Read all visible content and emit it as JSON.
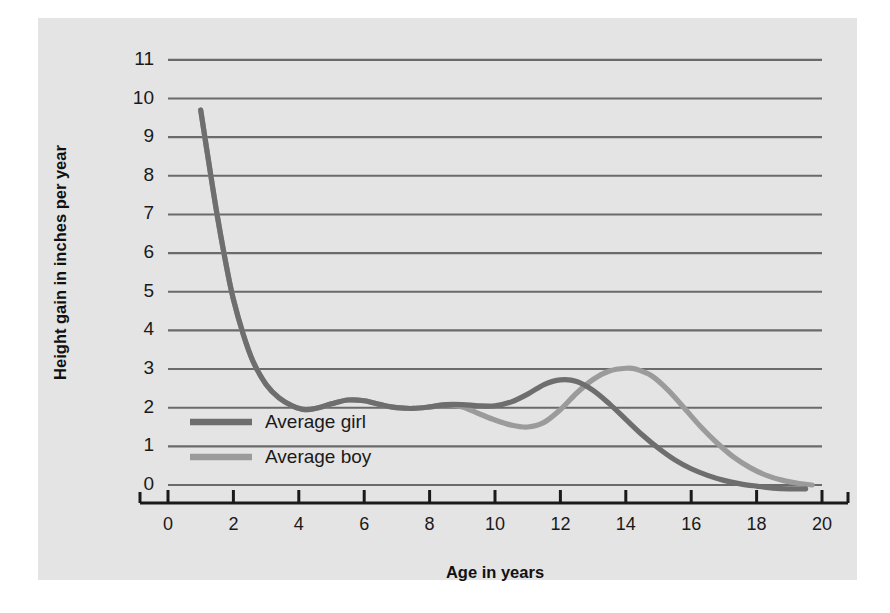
{
  "chart_data": {
    "type": "line",
    "title": "",
    "xlabel": "Age in years",
    "ylabel": "Height gain in inches per year",
    "xlim": [
      0,
      20
    ],
    "ylim": [
      0,
      11
    ],
    "grid": true,
    "legend_position": "inside-lower-left",
    "x_ticks": [
      "0",
      "2",
      "4",
      "6",
      "8",
      "10",
      "12",
      "14",
      "16",
      "18",
      "20"
    ],
    "y_ticks": [
      "0",
      "1",
      "2",
      "3",
      "4",
      "5",
      "6",
      "7",
      "8",
      "9",
      "10",
      "11"
    ],
    "series": [
      {
        "name": "Average girl",
        "color": "#6e6e6e",
        "x": [
          1.0,
          1.2,
          1.5,
          1.8,
          2.0,
          2.3,
          2.6,
          3.0,
          3.4,
          3.8,
          4.2,
          4.6,
          5.0,
          5.5,
          6.0,
          6.5,
          7.0,
          7.5,
          8.0,
          8.5,
          9.0,
          9.5,
          10.0,
          10.5,
          11.0,
          11.5,
          12.0,
          12.5,
          13.0,
          13.5,
          14.0,
          14.5,
          15.0,
          15.5,
          16.0,
          16.5,
          17.0,
          17.5,
          18.0,
          18.5,
          19.0,
          19.5
        ],
        "y": [
          9.7,
          8.6,
          7.0,
          5.6,
          4.8,
          3.9,
          3.2,
          2.6,
          2.25,
          2.05,
          1.95,
          2.0,
          2.1,
          2.2,
          2.18,
          2.08,
          2.0,
          1.98,
          2.02,
          2.08,
          2.08,
          2.05,
          2.05,
          2.15,
          2.35,
          2.6,
          2.72,
          2.68,
          2.45,
          2.1,
          1.7,
          1.3,
          0.95,
          0.65,
          0.42,
          0.25,
          0.12,
          0.03,
          -0.03,
          -0.08,
          -0.1,
          -0.1
        ]
      },
      {
        "name": "Average boy",
        "color": "#9b9b9b",
        "x": [
          1.0,
          1.2,
          1.5,
          1.8,
          2.0,
          2.3,
          2.6,
          3.0,
          3.4,
          3.8,
          4.2,
          4.6,
          5.0,
          5.5,
          6.0,
          6.5,
          7.0,
          7.5,
          8.0,
          8.5,
          9.0,
          9.5,
          10.0,
          10.5,
          11.0,
          11.5,
          12.0,
          12.5,
          13.0,
          13.5,
          14.0,
          14.3,
          14.8,
          15.3,
          15.8,
          16.3,
          16.8,
          17.3,
          17.8,
          18.3,
          18.8,
          19.3,
          19.7
        ],
        "y": [
          9.7,
          8.6,
          7.0,
          5.6,
          4.8,
          3.9,
          3.2,
          2.6,
          2.25,
          2.05,
          1.95,
          2.0,
          2.1,
          2.2,
          2.18,
          2.08,
          2.0,
          1.98,
          2.02,
          2.08,
          2.02,
          1.85,
          1.68,
          1.55,
          1.5,
          1.62,
          1.95,
          2.38,
          2.73,
          2.95,
          3.02,
          3.0,
          2.82,
          2.45,
          1.98,
          1.5,
          1.08,
          0.72,
          0.45,
          0.25,
          0.12,
          0.04,
          0.0
        ]
      }
    ],
    "legend": [
      {
        "label": "Average girl",
        "color": "#6e6e6e"
      },
      {
        "label": "Average boy",
        "color": "#9b9b9b"
      }
    ],
    "colors": {
      "panel_background": "#e4e4e4",
      "gridline": "#6a6a6a",
      "axis": "#1a1a1a",
      "text": "#1a1a1a"
    }
  }
}
